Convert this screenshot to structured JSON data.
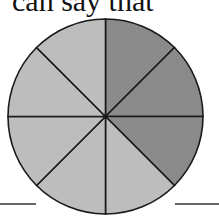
{
  "caption": {
    "text": "can say that"
  },
  "diagram": {
    "type": "fraction-circle",
    "total_parts": 8,
    "shaded_parts": 3,
    "colors": {
      "shaded": "#8a8a8a",
      "unshaded": "#bdbdbd",
      "stroke": "#1a1a1a"
    }
  },
  "chart_data": {
    "type": "pie",
    "categories": [
      "part 1",
      "part 2",
      "part 3",
      "part 4",
      "part 5",
      "part 6",
      "part 7",
      "part 8"
    ],
    "values": [
      1,
      1,
      1,
      1,
      1,
      1,
      1,
      1
    ],
    "shaded": [
      true,
      true,
      true,
      false,
      false,
      false,
      false,
      false
    ],
    "title": "",
    "note": "Circle divided into 8 equal parts, 3 shaded darker (3/8)"
  }
}
